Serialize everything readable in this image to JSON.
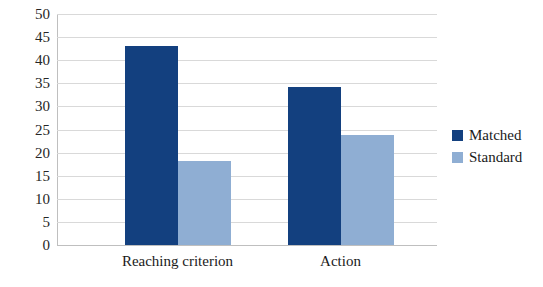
{
  "chart_data": {
    "type": "bar",
    "title": "",
    "subtitle": "",
    "xlabel": "",
    "ylabel": "",
    "categories": [
      "Reaching criterion",
      "Action"
    ],
    "series": [
      {
        "name": "Matched",
        "color": "#13407f",
        "values": [
          43.1,
          34.1
        ]
      },
      {
        "name": "Standard",
        "color": "#8faed3",
        "values": [
          18.1,
          23.9
        ]
      }
    ],
    "ylim": [
      0,
      50
    ],
    "y_tick_step": 5,
    "y_ticks": [
      50,
      45,
      40,
      35,
      30,
      25,
      20,
      15,
      10,
      5,
      0
    ],
    "grid": true,
    "grid_color": "#d9d9d9",
    "legend_position": "right",
    "legend": [
      {
        "label": "Matched",
        "color": "#13407f"
      },
      {
        "label": "Standard",
        "color": "#8faed3"
      }
    ],
    "background": "#ffffff"
  },
  "axis": {
    "y_tick_labels": [
      "50",
      "45",
      "40",
      "35",
      "30",
      "25",
      "20",
      "15",
      "10",
      "5",
      "0"
    ]
  },
  "categories": {
    "labels": [
      "Reaching criterion",
      "Action"
    ]
  },
  "legend": {
    "items": [
      {
        "label": "Matched"
      },
      {
        "label": "Standard"
      }
    ]
  }
}
